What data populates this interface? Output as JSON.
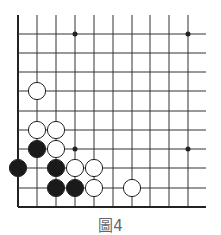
{
  "diagram": {
    "type": "go-board-fragment",
    "caption": "圖4",
    "grid": {
      "columns": 10,
      "rows": 10,
      "x_positions": [
        18,
        37,
        56,
        75,
        94,
        113,
        132,
        150,
        169,
        188
      ],
      "y_positions": [
        34,
        53,
        72,
        91,
        111,
        130,
        149,
        168,
        188,
        207
      ],
      "left_edge": true,
      "bottom_edge": true,
      "line_color": "#333333",
      "edge_color": "#222222"
    },
    "star_points": [
      {
        "col": 3,
        "row": 0
      },
      {
        "col": 9,
        "row": 0
      },
      {
        "col": 3,
        "row": 6
      },
      {
        "col": 9,
        "row": 6
      }
    ],
    "stones": [
      {
        "color": "white",
        "col": 1,
        "row": 3
      },
      {
        "color": "white",
        "col": 1,
        "row": 5
      },
      {
        "color": "white",
        "col": 2,
        "row": 5
      },
      {
        "color": "black",
        "col": 1,
        "row": 6
      },
      {
        "color": "white",
        "col": 2,
        "row": 6
      },
      {
        "color": "black",
        "col": 0,
        "row": 7
      },
      {
        "color": "black",
        "col": 2,
        "row": 7
      },
      {
        "color": "white",
        "col": 3,
        "row": 7
      },
      {
        "color": "white",
        "col": 4,
        "row": 7
      },
      {
        "color": "black",
        "col": 2,
        "row": 8
      },
      {
        "color": "black",
        "col": 3,
        "row": 8
      },
      {
        "color": "white",
        "col": 4,
        "row": 8
      },
      {
        "color": "white",
        "col": 6,
        "row": 8
      }
    ],
    "colors": {
      "black_stone": "#1a1a1a",
      "white_stone": "#ffffff",
      "stone_outline": "#222222",
      "caption": "#666666"
    }
  }
}
